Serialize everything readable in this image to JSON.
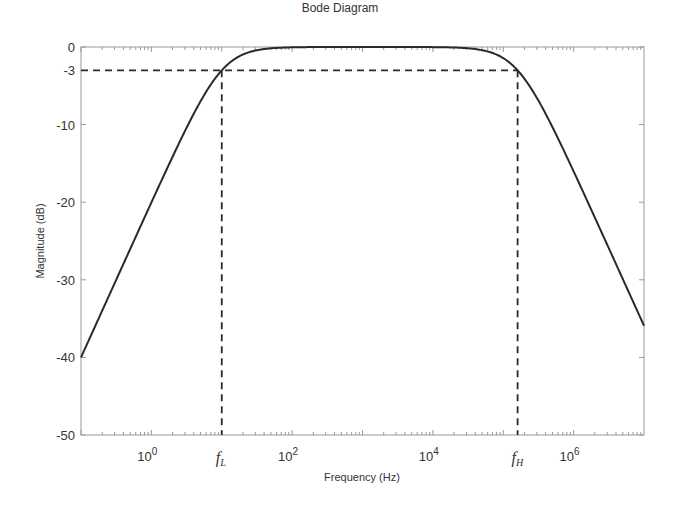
{
  "chart_data": {
    "type": "line",
    "title": "Bode Diagram",
    "xlabel": "Frequency  (Hz)",
    "ylabel": "Magnitude (dB)",
    "xscale": "log",
    "xlim": [
      0.1,
      10000000
    ],
    "ylim": [
      -50,
      0
    ],
    "grid": false,
    "x_ticks": [
      {
        "value": 1,
        "label_base": "10",
        "label_exp": "0"
      },
      {
        "value": 100,
        "label_base": "10",
        "label_exp": "2"
      },
      {
        "value": 10000,
        "label_base": "10",
        "label_exp": "4"
      },
      {
        "value": 1000000,
        "label_base": "10",
        "label_exp": "6"
      }
    ],
    "y_ticks": [
      {
        "value": 0,
        "label": "0"
      },
      {
        "value": -3,
        "label": "-3"
      },
      {
        "value": -10,
        "label": "-10"
      },
      {
        "value": -20,
        "label": "-20"
      },
      {
        "value": -30,
        "label": "-30"
      },
      {
        "value": -40,
        "label": "-40"
      },
      {
        "value": -50,
        "label": "-50"
      }
    ],
    "series": [
      {
        "name": "Magnitude",
        "description": "Band-pass response, 1st-order roll-off (20 dB/decade) on each side",
        "f_low_hz": 10,
        "f_high_hz": 160000,
        "x": [
          0.1,
          0.3,
          1,
          3,
          10,
          30,
          100,
          1000,
          10000,
          50000,
          160000,
          500000,
          1000000,
          3000000,
          10000000
        ],
        "values": [
          -40.0,
          -30.5,
          -20.0,
          -10.8,
          -3.0,
          -0.5,
          0.0,
          0.0,
          0.0,
          -0.4,
          -3.0,
          -10.3,
          -16.1,
          -25.5,
          -35.5
        ]
      }
    ],
    "annotations": [
      {
        "type": "hline_dashed",
        "y": -3,
        "label": "-3"
      },
      {
        "type": "vline_dashed",
        "x": 10,
        "label_main": "f",
        "label_sub": "L"
      },
      {
        "type": "vline_dashed",
        "x": 160000,
        "label_main": "f",
        "label_sub": "H"
      }
    ],
    "legend": "none"
  }
}
